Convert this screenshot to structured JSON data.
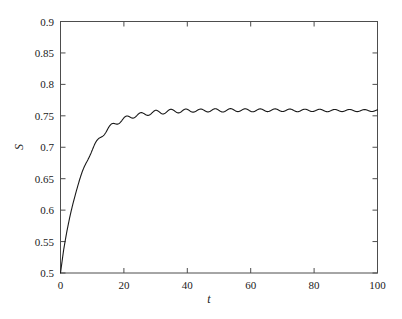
{
  "chart_data": {
    "type": "line",
    "title": "",
    "subtitle": "",
    "xlabel": "t",
    "ylabel": "S",
    "xlim": [
      0,
      100
    ],
    "ylim": [
      0.5,
      0.9
    ],
    "grid": false,
    "legend": null,
    "legend_position": "none",
    "xticks": [
      0,
      20,
      40,
      60,
      80,
      100
    ],
    "xtick_labels": [
      "0",
      "20",
      "40",
      "60",
      "80",
      "100"
    ],
    "yticks": [
      0.5,
      0.55,
      0.6,
      0.65,
      0.7,
      0.75,
      0.8,
      0.85,
      0.9
    ],
    "ytick_labels": [
      "0.5",
      "0.55",
      "0.6",
      "0.65",
      "0.7",
      "0.75",
      "0.8",
      "0.85",
      "0.9"
    ],
    "line_color": "#1a1a1a",
    "line_width": 1.1,
    "axis_color": "#4d4d4d",
    "background_color": "#ffffff",
    "annotations": [],
    "series": [
      {
        "name": "S(t)",
        "x": [
          0,
          1,
          2,
          3,
          4,
          5,
          6,
          7,
          8,
          9,
          10,
          11,
          12,
          13,
          14,
          15,
          16,
          17,
          18,
          19,
          20,
          22,
          24,
          26,
          28,
          30,
          32,
          34,
          36,
          38,
          40,
          42,
          44,
          46,
          48,
          50,
          55,
          60,
          65,
          70,
          75,
          80,
          85,
          90,
          95,
          100
        ],
        "y": [
          0.5,
          0.547,
          0.58,
          0.607,
          0.63,
          0.65,
          0.667,
          0.682,
          0.695,
          0.706,
          0.716,
          0.725,
          0.732,
          0.738,
          0.743,
          0.747,
          0.75,
          0.753,
          0.755,
          0.7565,
          0.7575,
          0.7595,
          0.7605,
          0.759,
          0.7605,
          0.7615,
          0.7595,
          0.761,
          0.7615,
          0.7595,
          0.7605,
          0.761,
          0.759,
          0.7605,
          0.7605,
          0.759,
          0.7605,
          0.759,
          0.7595,
          0.7595,
          0.7585,
          0.759,
          0.758,
          0.7585,
          0.758,
          0.7585
        ]
      }
    ]
  },
  "axes": {
    "x_label_text": "t",
    "y_label_text": "S"
  }
}
